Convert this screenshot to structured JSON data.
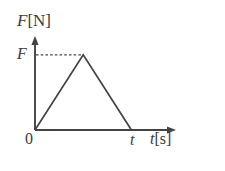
{
  "figure": {
    "background_color": "#ffffff",
    "stroke_color": "#434343",
    "text_color": "#3a3a3a",
    "width": 225,
    "height": 171
  },
  "labels": {
    "y_axis_title_variable": "F",
    "y_axis_title_unit": "[N]",
    "x_axis_title_variable": "t",
    "x_axis_title_unit": "[s]",
    "y_tick_label": "F",
    "origin_label": "0",
    "x_tick_label": "t"
  },
  "chart_data": {
    "type": "line",
    "title": "",
    "xlabel": "t[s]",
    "ylabel": "F[N]",
    "grid": false,
    "legend": "none",
    "xlim": [
      0,
      1.4
    ],
    "ylim": [
      0,
      1.25
    ],
    "x_tick_labels": [
      "0",
      "t"
    ],
    "x_tick_values": [
      0,
      1
    ],
    "y_tick_labels": [
      "F"
    ],
    "y_tick_values": [
      1
    ],
    "series": [
      {
        "name": "Force",
        "style": "solid",
        "x": [
          0,
          0.5,
          1
        ],
        "values": [
          0,
          1,
          0
        ]
      }
    ],
    "annotations": [
      {
        "name": "peak-guide-dash",
        "style": "dashed",
        "from": [
          0,
          1
        ],
        "to": [
          0.5,
          1
        ],
        "describes": "horizontal dashed line from F on the vertical axis to the triangle apex"
      }
    ]
  }
}
